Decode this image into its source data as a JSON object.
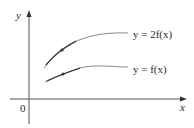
{
  "diagram": {
    "axes": {
      "x_label": "x",
      "y_label": "y",
      "origin_label": "0"
    },
    "curves": [
      {
        "name": "y = 2f(x)",
        "label": "y = 2f(x)",
        "color": "#8a8a8a",
        "highlight_color": "#2f2f2f",
        "tangent_point_color": "#3a3a3a"
      },
      {
        "name": "y = f(x)",
        "label": "y = f(x)",
        "color": "#8a8a8a",
        "highlight_color": "#2f2f2f",
        "tangent_point_color": "#3a3a3a"
      }
    ],
    "colors": {
      "axis": "#555555",
      "text": "#2a2a2a",
      "background": "#ffffff"
    }
  }
}
